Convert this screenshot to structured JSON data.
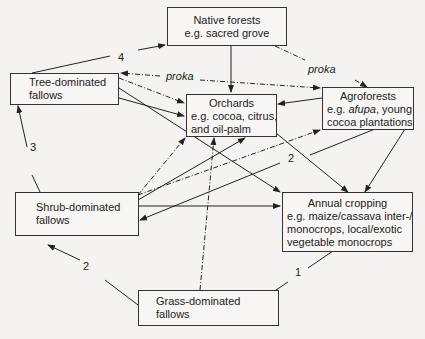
{
  "nodes": {
    "native_forests": {
      "title": "Native forests",
      "example": "e.g. sacred grove"
    },
    "tree_fallows": {
      "line1": "Tree-dominated",
      "line2": "fallows"
    },
    "orchards": {
      "title": "Orchards",
      "line2": "e.g. cocoa, citrus,",
      "line3": "and oil-palm"
    },
    "agroforests": {
      "title": "Agroforests",
      "prefix": "e.g. ",
      "italic": "afupa",
      "suffix": ", young",
      "line3": "cocoa plantations"
    },
    "shrub_fallows": {
      "line1": "Shrub-dominated",
      "line2": "fallows"
    },
    "annual_cropping": {
      "title": "Annual cropping",
      "line2": "e.g. maize/cassava inter-/",
      "line3": "monocrops, local/exotic",
      "line4": "vegetable monocrops"
    },
    "grass_fallows": {
      "line1": "Grass-dominated",
      "line2": "fallows"
    }
  },
  "edge_labels": {
    "tree_to_native": "4",
    "shrub_to_tree": "3",
    "grass_to_shrub": "2",
    "annual_to_grass": "1",
    "agro_to_shrub": "2",
    "proka_left": "proka",
    "proka_right": "proka"
  },
  "colors": {
    "line": "#222222",
    "background": "#f4f3f1"
  }
}
